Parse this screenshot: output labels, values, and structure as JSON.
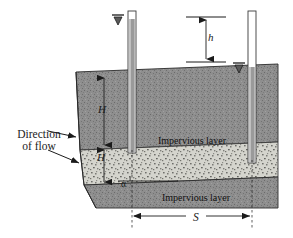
{
  "figure": {
    "type": "engineering-cross-section",
    "labels": {
      "direction_line1": "Direction",
      "direction_line2": "of flow",
      "head_loss": "h",
      "upper_thickness": "H",
      "layer_thickness": "H",
      "angle": "α",
      "spacing": "S",
      "impervious_upper": "Impervious layer",
      "impervious_lower": "Impervious layer"
    },
    "colors": {
      "dark_soil": "#8c8c8c",
      "light_soil": "#d2d2cb",
      "line": "#1b1b1b",
      "tube_fill": "#9a9a9a",
      "tube_empty": "#ffffff",
      "background": "#ffffff"
    },
    "elements": {
      "piezometer_left": "left standpipe, water level at top of tube",
      "piezometer_right": "right standpipe, water level lower by h",
      "water_marker_left": "downward triangle water-surface symbol",
      "water_marker_right": "downward triangle water-surface symbol",
      "flow_arrow_upper": "arrow pointing right into upper soil",
      "flow_arrow_lower": "arrow pointing right into pervious layer"
    }
  }
}
